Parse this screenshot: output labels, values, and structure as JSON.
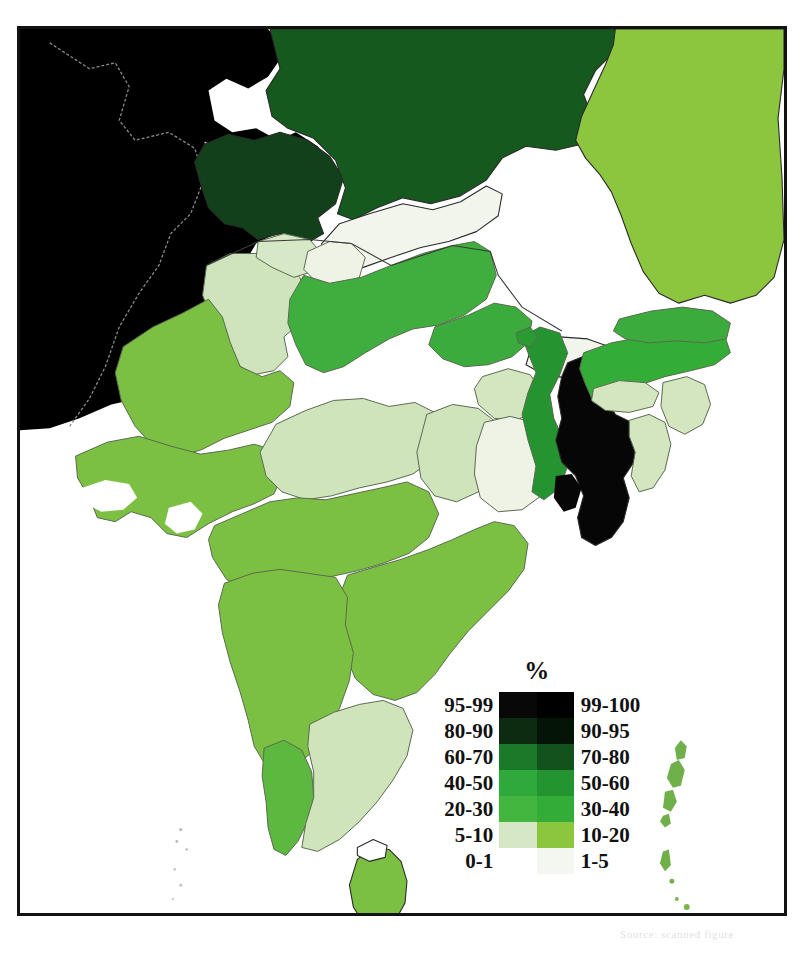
{
  "figure": {
    "type": "choropleth-map",
    "region": "South Asia",
    "frame_border_color": "#121212",
    "background": "#ffffff"
  },
  "legend": {
    "title": "%",
    "position": "lower-center",
    "columns": 2,
    "rows": [
      {
        "left_label": "95-99",
        "left_color": "#080808",
        "right_label": "99-100",
        "right_color": "#000000"
      },
      {
        "left_label": "80-90",
        "left_color": "#0c2b10",
        "right_label": "90-95",
        "right_color": "#041406"
      },
      {
        "left_label": "60-70",
        "left_color": "#1b7a2a",
        "right_label": "70-80",
        "right_color": "#14521d"
      },
      {
        "left_label": "40-50",
        "left_color": "#2fa83c",
        "right_label": "50-60",
        "right_color": "#249430"
      },
      {
        "left_label": "20-30",
        "left_color": "#43b63f",
        "right_label": "30-40",
        "right_color": "#34ad38"
      },
      {
        "left_label": "5-10",
        "left_color": "#d5e7c4",
        "right_label": "10-20",
        "right_color": "#8cc63f"
      },
      {
        "left_label": "0-1",
        "left_color": "#ffffff",
        "right_label": "1-5",
        "right_color": "#f4f7ef"
      }
    ]
  },
  "colors": {
    "black_99_100": "#000000",
    "dark_95_99": "#080808",
    "very_dark_green_90_95": "#041406",
    "dark_green_80_90": "#0c2b10",
    "forest_green_70_80": "#14521d",
    "green_60_70": "#1b7a2a",
    "mid_green_50_60": "#249430",
    "bright_green_40_50": "#2fa83c",
    "green_30_40": "#34ad38",
    "lime_20_30": "#43b63f",
    "yellow_green_10_20": "#8cc63f",
    "pale_green_5_10": "#d5e7c4",
    "near_white_1_5": "#f4f7ef",
    "white_0_1": "#ffffff",
    "state_border": "#5a6a4f",
    "country_border": "#2a2a2a"
  },
  "regions": [
    {
      "name": "Afghanistan",
      "band": "99-100",
      "color": "#000000"
    },
    {
      "name": "Pakistan",
      "band": "99-100",
      "color": "#000000"
    },
    {
      "name": "Pakistan-Kashmir",
      "band": "99-100",
      "color": "#050505"
    },
    {
      "name": "Jammu-and-Kashmir",
      "band": "80-90",
      "color": "#11401a"
    },
    {
      "name": "China-Tibet",
      "band": "70-80",
      "color": "#15591f"
    },
    {
      "name": "China-Xinjiang-north",
      "band": "70-80",
      "color": "#14521d"
    },
    {
      "name": "Nepal",
      "band": "1-5",
      "color": "#f2f5ec"
    },
    {
      "name": "Bhutan",
      "band": "1-5",
      "color": "#f2f5ec"
    },
    {
      "name": "Bangladesh",
      "band": "99-100",
      "color": "#060606"
    },
    {
      "name": "Myanmar",
      "band": "10-20",
      "color": "#8cc63f"
    },
    {
      "name": "Sri-Lanka",
      "band": "10-20",
      "color": "#7cc043"
    },
    {
      "name": "Punjab-Haryana",
      "band": "5-10",
      "color": "#cfe3bd"
    },
    {
      "name": "Himachal-Pradesh",
      "band": "5-10",
      "color": "#d6e8c6"
    },
    {
      "name": "Uttarakhand",
      "band": "1-5",
      "color": "#eef3e6"
    },
    {
      "name": "Uttar-Pradesh",
      "band": "30-40",
      "color": "#3fae3f"
    },
    {
      "name": "Bihar",
      "band": "30-40",
      "color": "#3cab3d"
    },
    {
      "name": "Rajasthan",
      "band": "20-30",
      "color": "#7cc043"
    },
    {
      "name": "Gujarat",
      "band": "20-30",
      "color": "#7cc043"
    },
    {
      "name": "Madhya-Pradesh",
      "band": "5-10",
      "color": "#cfe4bb"
    },
    {
      "name": "Chhattisgarh",
      "band": "5-10",
      "color": "#cfe4bb"
    },
    {
      "name": "Jharkhand",
      "band": "5-10",
      "color": "#d3e6bf"
    },
    {
      "name": "Odisha",
      "band": "1-5",
      "color": "#eef3e6"
    },
    {
      "name": "West-Bengal",
      "band": "50-60",
      "color": "#259430"
    },
    {
      "name": "Sikkim",
      "band": "50-60",
      "color": "#2a9b33"
    },
    {
      "name": "Assam",
      "band": "40-50",
      "color": "#34ad38"
    },
    {
      "name": "Meghalaya",
      "band": "5-10",
      "color": "#d3e6bf"
    },
    {
      "name": "Arunachal-Pradesh",
      "band": "30-40",
      "color": "#3cab3d"
    },
    {
      "name": "Tripura-Mizoram",
      "band": "5-10",
      "color": "#d3e6bf"
    },
    {
      "name": "Manipur-Nagaland",
      "band": "5-10",
      "color": "#d3e6bf"
    },
    {
      "name": "Maharashtra",
      "band": "20-30",
      "color": "#7cc043"
    },
    {
      "name": "Telangana-Andhra",
      "band": "20-30",
      "color": "#7cc043"
    },
    {
      "name": "Karnataka",
      "band": "20-30",
      "color": "#7cc043"
    },
    {
      "name": "Kerala",
      "band": "30-40",
      "color": "#5cb83f"
    },
    {
      "name": "Tamil-Nadu",
      "band": "5-10",
      "color": "#cfe4bb"
    },
    {
      "name": "Andaman-Nicobar-Islands",
      "band": "20-30",
      "color": "#6fb04a"
    },
    {
      "name": "Lakshadweep",
      "band": "1-5",
      "color": "#d8d8d8"
    }
  ],
  "caption": {
    "ghost_text": "Source: scanned figure"
  }
}
